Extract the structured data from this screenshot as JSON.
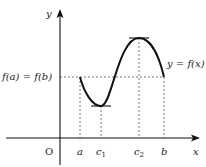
{
  "diagram": {
    "axes": {
      "x_label": "x",
      "y_label": "y",
      "origin_label": "O"
    },
    "x_ticks": [
      {
        "name": "a",
        "label": "a"
      },
      {
        "name": "c1",
        "label": "c",
        "sub": "1"
      },
      {
        "name": "c2",
        "label": "c",
        "sub": "2"
      },
      {
        "name": "b",
        "label": "b"
      }
    ],
    "y_level_label": "f(a) = f(b)",
    "curve_label": "y = f(x)",
    "colors": {
      "curve": "#111111",
      "axes": "#111111",
      "dashed": "#555555"
    }
  }
}
